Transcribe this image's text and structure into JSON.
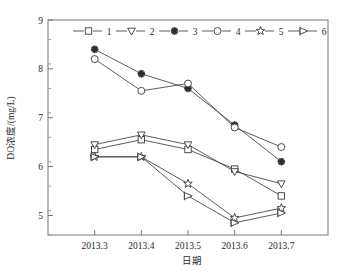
{
  "chart_data": {
    "type": "line",
    "title": "",
    "xlabel": "日期",
    "ylabel": "DO浓度/(mg/L)",
    "categories": [
      "2013.3",
      "2013.4",
      "2013.5",
      "2013.6",
      "2013.7"
    ],
    "x_tick_labels": [
      "2013.3",
      "2013.4",
      "2013.5",
      "2013.6",
      "2013.7"
    ],
    "y_tick_labels": [
      "5",
      "6",
      "7",
      "8",
      "9"
    ],
    "y_ticks": [
      5,
      6,
      7,
      8,
      9
    ],
    "ylim": [
      4.6,
      9
    ],
    "xlim": [
      0,
      6
    ],
    "grid": false,
    "legend_position": "top-inside",
    "minor_ticks": true,
    "series": [
      {
        "name": "1",
        "marker": "square-open",
        "values": [
          6.35,
          6.55,
          6.35,
          5.95,
          5.4
        ]
      },
      {
        "name": "2",
        "marker": "triangle-down-open",
        "values": [
          6.45,
          6.65,
          6.45,
          5.9,
          5.65
        ]
      },
      {
        "name": "3",
        "marker": "asterisk-filled",
        "values": [
          8.4,
          7.9,
          7.6,
          6.85,
          6.1
        ]
      },
      {
        "name": "4",
        "marker": "circle-open",
        "values": [
          8.2,
          7.55,
          7.7,
          6.8,
          6.4
        ]
      },
      {
        "name": "5",
        "marker": "star-open",
        "values": [
          6.2,
          6.2,
          5.65,
          4.95,
          5.15
        ]
      },
      {
        "name": "6",
        "marker": "flag-right-open",
        "values": [
          6.2,
          6.2,
          5.4,
          4.85,
          5.05
        ]
      }
    ]
  },
  "legend": {
    "entries": [
      {
        "label": "1",
        "marker": "square-open"
      },
      {
        "label": "2",
        "marker": "triangle-down-open"
      },
      {
        "label": "3",
        "marker": "asterisk-filled"
      },
      {
        "label": "4",
        "marker": "circle-open"
      },
      {
        "label": "5",
        "marker": "star-open"
      },
      {
        "label": "6",
        "marker": "flag-right-open"
      }
    ]
  }
}
